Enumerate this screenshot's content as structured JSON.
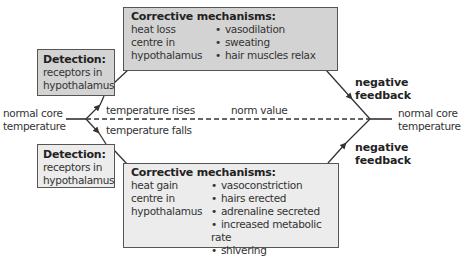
{
  "left_label": [
    "normal core",
    "temperature"
  ],
  "right_label": [
    "normal core",
    "temperature"
  ],
  "norm_value": "norm value",
  "temp_rises": "temperature rises",
  "temp_falls": "temperature falls",
  "top": {
    "detection": {
      "title": "Detection:",
      "lines": [
        "receptors in",
        "hypothalamus"
      ]
    },
    "corrective": {
      "title": "Corrective mechanisms:",
      "centre": [
        "heat loss",
        "centre in",
        "hypothalamus"
      ],
      "mechanisms": [
        "vasodilation",
        "sweating",
        "hair muscles relax"
      ]
    },
    "feedback": [
      "negative",
      "feedback"
    ]
  },
  "bottom": {
    "detection": {
      "title": "Detection:",
      "lines": [
        "receptors in",
        "hypothalamus"
      ]
    },
    "corrective": {
      "title": "Corrective mechanisms:",
      "centre": [
        "heat gain",
        "centre in",
        "hypothalamus"
      ],
      "mechanisms": [
        "vasoconstriction",
        "hairs erected",
        "adrenaline secreted",
        "increased metabolic rate",
        "shivering"
      ]
    },
    "feedback": [
      "negative",
      "feedback"
    ]
  },
  "colors": {
    "box_dark": "#d3d3d3",
    "box_light": "#ececec",
    "line": "#333333"
  }
}
